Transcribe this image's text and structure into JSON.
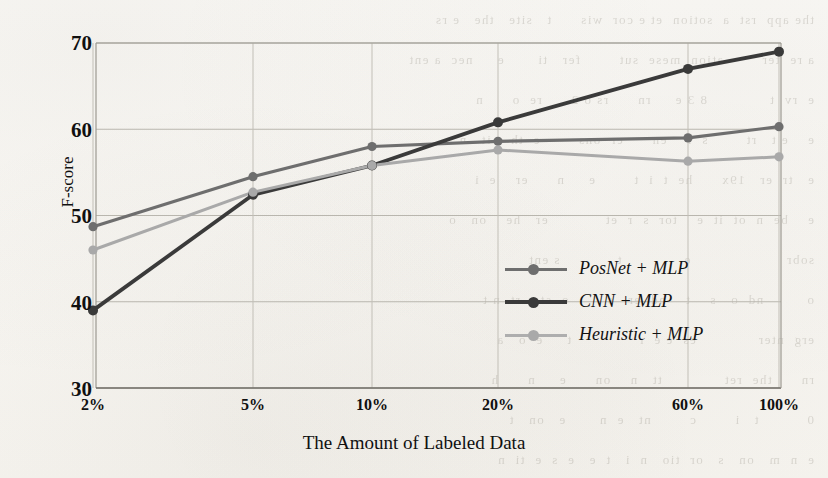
{
  "chart_data": {
    "type": "line",
    "title": "",
    "xlabel": "The Amount of Labeled Data",
    "ylabel": "F-score",
    "categories": [
      "2%",
      "5%",
      "10%",
      "20%",
      "60%",
      "100%"
    ],
    "ylim": [
      30,
      70
    ],
    "yticks": [
      30,
      40,
      50,
      60,
      70
    ],
    "grid": true,
    "legend_position": "inside-lower-right",
    "series": [
      {
        "name": "PosNet + MLP",
        "color": "#6e6e6e",
        "values": [
          48.7,
          54.5,
          58.0,
          58.6,
          59.0,
          60.3
        ]
      },
      {
        "name": "CNN + MLP",
        "color": "#3a3a3a",
        "values": [
          39.0,
          52.4,
          55.8,
          60.8,
          67.0,
          69.0
        ]
      },
      {
        "name": "Heuristic + MLP",
        "color": "#a9a9a9",
        "values": [
          46.0,
          52.7,
          55.8,
          57.6,
          56.3,
          56.8
        ]
      }
    ]
  },
  "axes": {
    "y_tick_labels": [
      "70",
      "60",
      "50",
      "40",
      "30"
    ],
    "x_tick_labels": [
      "2%",
      "5%",
      "10%",
      "20%",
      "60%",
      "100%"
    ]
  },
  "legend": {
    "items": [
      {
        "label": "PosNet + MLP"
      },
      {
        "label": "CNN + MLP"
      },
      {
        "label": "Heuristic + MLP"
      }
    ]
  },
  "background_text": [
    "the app  rst  a  sotion  et e cor  wis      t   site   the   e rs",
    "a re  ter        ation  mese  sut        fer   ti       e     nec  a ent",
    "e  rv  t             8 3 e     rn      rs o 2      re  o      n",
    "e    e t   rt        s  r    en      er  ons        e  th    it   n",
    "e   tr  er   19x      he  t  i  t        e     n      er    e  i",
    "e    be  n  ot  it  e    tor  s  r  et            er   he    on   o",
    "sobr                    e             t            s ent",
    "o         nd  o   s    t    nd  er   s        o  st    rt  n t",
    "erg  nter             es  e e  r              t     e  o   a",
    "rn      the  ret             tt   n    on      e     n      h",
    "0          t   i        c        nt   e  n       e   on   t",
    "e  n  m   on   s   or  tio   n  i   t  e   e  s  e  ti  n"
  ]
}
